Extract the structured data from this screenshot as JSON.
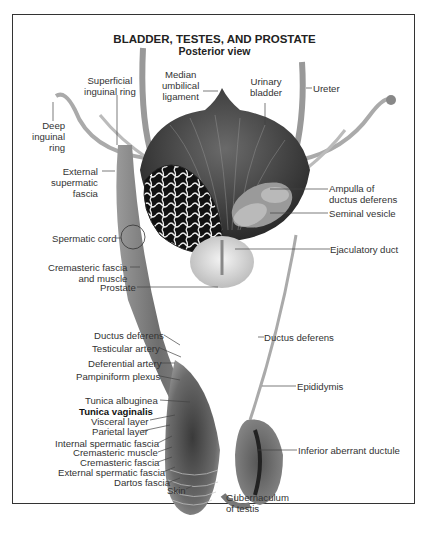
{
  "figure": {
    "title": "BLADDER, TESTES, AND PROSTATE",
    "subtitle": "Posterior view"
  },
  "labels": {
    "superficial_inguinal_ring": [
      "Superficial",
      "inguinal ring"
    ],
    "median_umbilical_ligament": [
      "Median",
      "umbilical",
      "ligament"
    ],
    "urinary_bladder": [
      "Urinary",
      "bladder"
    ],
    "ureter": "Ureter",
    "deep_inguinal_ring": [
      "Deep",
      "inguinal",
      "ring"
    ],
    "external_supermatic_fascia": [
      "External",
      "supermatic",
      "fascia"
    ],
    "ampulla": [
      "Ampulla of",
      "ductus deferens"
    ],
    "seminal_vesicle": "Seminal vesicle",
    "spermatic_cord": "Spermatic cord",
    "ejaculatory_duct": "Ejaculatory duct",
    "cremasteric_fascia_muscle": [
      "Cremasteric fascia",
      "and muscle"
    ],
    "prostate": "Prostate",
    "ductus_deferens_right": "Ductus deferens",
    "ductus_deferens_left": "Ductus deferens",
    "testicular_artery": "Testicular artery",
    "deferential_artery": "Deferential artery",
    "pampiniform_plexus": "Pampiniform plexus",
    "epididymis": "Epididymis",
    "tunica_albuginea": "Tunica albuginea",
    "tunica_vaginalis": "Tunica vaginalis",
    "visceral_layer": "Visceral layer",
    "parietal_layer": "Parietal layer",
    "internal_spermatic_fascia": "Internal spermatic fascia",
    "cremasteric_muscle": "Cremasteric muscle",
    "cremasteric_fascia": "Cremasteric fascia",
    "external_spermatic_fascia": "External spermatic fascia",
    "dartos_fascia": "Dartos fascia",
    "skin": "Skin",
    "inferior_aberrant_ductule": "Inferior aberrant ductule",
    "gubernaculum": [
      "Gubernaculum",
      "of testis"
    ]
  }
}
